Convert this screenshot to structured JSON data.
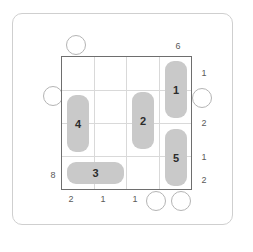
{
  "puzzle": {
    "title": "domino-placement-grid",
    "grid": {
      "rows": 4,
      "cols": 4
    },
    "colors": {
      "tile_fill": "#c9c9c9",
      "grid_border": "#6e6e6e",
      "grid_line": "#d9d9d9",
      "frame": "#cfcfcf",
      "marker_stroke": "#b4b4b4",
      "text": "#2c2c2c",
      "clue_text": "#5a5a5a",
      "background": "#ffffff"
    },
    "tiles": [
      {
        "id": "tile-4",
        "label": "4",
        "orientation": "vertical",
        "col": 0,
        "row": 1,
        "span": 2
      },
      {
        "id": "tile-2",
        "label": "2",
        "orientation": "vertical",
        "col": 2,
        "row": 1,
        "span": 2
      },
      {
        "id": "tile-1",
        "label": "1",
        "orientation": "vertical",
        "col": 3,
        "row": 0,
        "span": 2
      },
      {
        "id": "tile-5",
        "label": "5",
        "orientation": "vertical",
        "col": 3,
        "row": 2,
        "span": 2
      },
      {
        "id": "tile-3",
        "label": "3",
        "orientation": "horizontal",
        "col": 0,
        "row": 3,
        "span": 2
      }
    ],
    "clues": {
      "top": [
        {
          "col": 3,
          "value": "6"
        }
      ],
      "right": [
        {
          "value": "1"
        },
        {
          "value": "2"
        },
        {
          "value": "1"
        },
        {
          "value": "2"
        }
      ],
      "bottom": [
        {
          "value": "2"
        },
        {
          "value": "1"
        },
        {
          "value": "1"
        }
      ],
      "left": [
        {
          "row": 3,
          "value": "8"
        }
      ]
    },
    "markers": [
      {
        "id": "marker-top",
        "side": "top",
        "x": 66,
        "y": 35,
        "size": 20
      },
      {
        "id": "marker-left",
        "side": "left",
        "x": 43,
        "y": 86,
        "size": 20
      },
      {
        "id": "marker-right",
        "side": "right",
        "x": 192,
        "y": 88,
        "size": 20
      },
      {
        "id": "marker-bottom-left",
        "side": "bottom",
        "x": 146,
        "y": 191,
        "size": 20
      },
      {
        "id": "marker-bottom-right",
        "side": "bottom",
        "x": 171,
        "y": 191,
        "size": 20
      }
    ]
  }
}
